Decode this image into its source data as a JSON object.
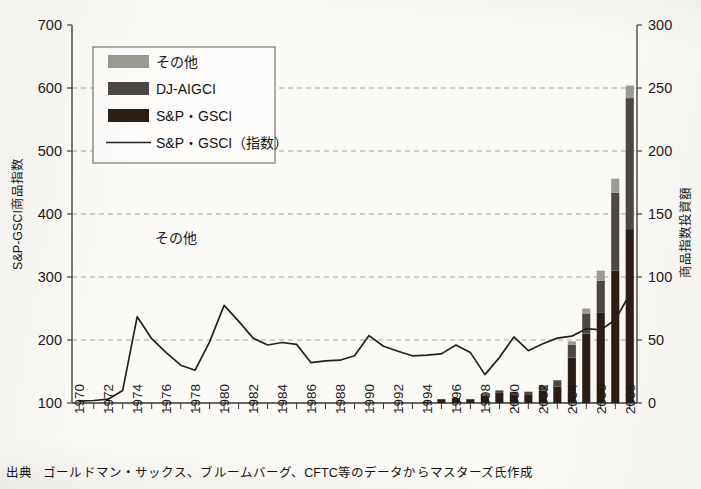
{
  "figure": {
    "source_label": "出典",
    "source_text": "ゴールドマン・サックス、ブルームバーグ、CFTC等のデータからマスターズ氏作成",
    "plot_annotation": "その他"
  },
  "colors": {
    "series_other": "#9b9a93",
    "series_djaigci": "#4b4744",
    "series_spgsci": "#2b1e17",
    "line": "#23211e",
    "grid": "#8e8b86",
    "axis": "#3a3734",
    "background": "#fbfaf7"
  },
  "legend": {
    "items": [
      {
        "label": "その他",
        "type": "swatch",
        "color_key": "series_other"
      },
      {
        "label": "DJ-AIGCI",
        "type": "swatch",
        "color_key": "series_djaigci"
      },
      {
        "label": "S&P・GSCI",
        "type": "swatch",
        "color_key": "series_spgsci"
      },
      {
        "label": "S&P・GSCI（指数）",
        "type": "line",
        "color_key": "line"
      }
    ]
  },
  "chart_data": {
    "type": "bar",
    "title": "",
    "subtitle": "",
    "xlabel": "",
    "ylabel": "S&P-GSCI商品指数",
    "y2label": "商品指数投資額",
    "ylim": [
      100,
      700
    ],
    "y2lim": [
      0,
      300
    ],
    "yticks": [
      100,
      200,
      300,
      400,
      500,
      600,
      700
    ],
    "y2ticks": [
      0,
      50,
      100,
      150,
      200,
      250,
      300
    ],
    "grid": true,
    "grid_axis": "y",
    "legend_position": "upper-left-inset",
    "x": [
      1970,
      1971,
      1972,
      1973,
      1974,
      1975,
      1976,
      1977,
      1978,
      1979,
      1980,
      1981,
      1982,
      1983,
      1984,
      1985,
      1986,
      1987,
      1988,
      1989,
      1990,
      1991,
      1992,
      1993,
      1994,
      1995,
      1996,
      1997,
      1998,
      1999,
      2000,
      2001,
      2002,
      2003,
      2004,
      2005,
      2006,
      2007,
      2008
    ],
    "xtick_labels": [
      "1970",
      "1972",
      "1974",
      "1976",
      "1978",
      "1980",
      "1982",
      "1984",
      "1986",
      "1988",
      "1990",
      "1992",
      "1994",
      "1996",
      "1998",
      "2000",
      "2002",
      "2004",
      "2006",
      "2008"
    ],
    "xtick_step_years": 2,
    "bar_axis": "right",
    "bar_unit": "商品指数投資額",
    "stacked": true,
    "series": [
      {
        "name": "S&P・GSCI",
        "color_key": "series_spgsci",
        "values": [
          0,
          0,
          0,
          0,
          0,
          0,
          0,
          0,
          0,
          0,
          0,
          0,
          0,
          0,
          0,
          0,
          0,
          0,
          0,
          0,
          0,
          0,
          0,
          0,
          1,
          3,
          4,
          3,
          6,
          8,
          7,
          7,
          10,
          13,
          36,
          55,
          72,
          105,
          138
        ]
      },
      {
        "name": "DJ-AIGCI",
        "color_key": "series_djaigci",
        "values": [
          0,
          0,
          0,
          0,
          0,
          0,
          0,
          0,
          0,
          0,
          0,
          0,
          0,
          0,
          0,
          0,
          0,
          0,
          0,
          0,
          0,
          0,
          0,
          0,
          0,
          0,
          0,
          0,
          1,
          2,
          2,
          2,
          4,
          5,
          10,
          16,
          25,
          62,
          104
        ]
      },
      {
        "name": "その他",
        "color_key": "series_other",
        "values": [
          0,
          0,
          0,
          0,
          0,
          0,
          0,
          0,
          0,
          0,
          0,
          0,
          0,
          0,
          0,
          0,
          0,
          0,
          0,
          0,
          0,
          0,
          0,
          0,
          0,
          0,
          0,
          0,
          0,
          0,
          0,
          0,
          0,
          0,
          3,
          4,
          8,
          11,
          10
        ]
      }
    ],
    "line_series": {
      "name": "S&P・GSCI（指数）",
      "axis": "left",
      "color_key": "line",
      "values": [
        103,
        104,
        106,
        120,
        237,
        202,
        180,
        160,
        152,
        197,
        255,
        230,
        203,
        192,
        196,
        193,
        164,
        167,
        168,
        175,
        207,
        190,
        182,
        175,
        176,
        178,
        192,
        180,
        145,
        172,
        205,
        183,
        194,
        203,
        206,
        218,
        216,
        232,
        273
      ]
    }
  },
  "axes": {
    "left_title": "S&P-GSCI商品指数",
    "right_title": "商品指数投資額",
    "left_ticks": [
      "700",
      "600",
      "500",
      "400",
      "300",
      "200",
      "100"
    ],
    "right_ticks": [
      "300",
      "250",
      "200",
      "150",
      "100",
      "50",
      "0"
    ]
  }
}
